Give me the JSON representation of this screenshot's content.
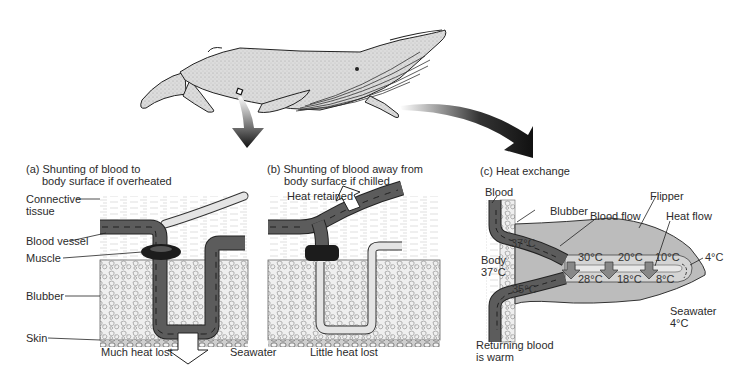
{
  "panels": {
    "a": {
      "title_line1": "(a) Shunting of blood to",
      "title_line2": "body surface if overheated",
      "labels": {
        "connective_tissue_1": "Connective",
        "connective_tissue_2": "tissue",
        "blood_vessel": "Blood vessel",
        "muscle": "Muscle",
        "blubber": "Blubber",
        "skin": "Skin"
      },
      "caption": "Much heat lost"
    },
    "b": {
      "title_line1": "(b) Shunting of blood away from",
      "title_line2": "body surface if chilled",
      "heat_label": "Heat retained",
      "caption": "Little heat lost"
    },
    "c": {
      "title": "(c) Heat exchange",
      "labels": {
        "blood": "Blood",
        "blubber": "Blubber",
        "blood_flow": "Blood flow",
        "flipper": "Flipper",
        "heat_flow": "Heat flow",
        "body_1": "Body",
        "body_2": "37°C",
        "seawater_1": "Seawater",
        "seawater_2": "4°C",
        "returning_1": "Returning blood",
        "returning_2": "is warm"
      },
      "temperatures": {
        "artery_entry": "37°C",
        "vein_exit": "35°C",
        "out_1": "30°C",
        "out_2": "20°C",
        "out_3": "10°C",
        "tip": "4°C",
        "back_1": "28°C",
        "back_2": "18°C",
        "back_3": "8°C"
      }
    }
  },
  "shared": {
    "seawater_label": "Seawater"
  },
  "colors": {
    "vessel_dark": "#5a5a5a",
    "vessel_light": "#d6d6d6",
    "muscle": "#1e1e1e",
    "blubber_fill": "#eeeeee",
    "flipper_fill": "#b9b9b9",
    "whale_fill": "#d9d9d9",
    "arrow": "#111111"
  }
}
